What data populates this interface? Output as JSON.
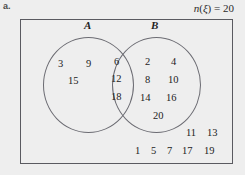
{
  "figure": {
    "part_label": "a.",
    "universal_set": {
      "function_name": "n",
      "open_paren": "(",
      "symbol": "ξ",
      "close_paren": ")",
      "equals": " = ",
      "count": "20",
      "full_text": "n(ξ) = 20"
    },
    "sets": {
      "a_label": "A",
      "b_label": "B"
    }
  },
  "chart_data": {
    "type": "venn",
    "title": "",
    "universal_set_label": "ξ",
    "universal_set_size": 20,
    "sets": [
      "A",
      "B"
    ],
    "regions": {
      "a_only": [
        3,
        9,
        15
      ],
      "intersection": [
        6,
        12,
        18
      ],
      "b_only": [
        2,
        4,
        8,
        10,
        14,
        16,
        20
      ],
      "outside": [
        11,
        13,
        1,
        5,
        7,
        17,
        19
      ]
    },
    "outside_rows": [
      [
        11,
        13
      ],
      [
        1,
        5,
        7,
        17,
        19
      ]
    ],
    "a_only_strings": [
      "3",
      "9",
      "15"
    ],
    "intersection_strings": [
      "6",
      "12",
      "18"
    ],
    "b_only_strings": [
      "2",
      "4",
      "8",
      "10",
      "14",
      "16",
      "20"
    ],
    "outside_row1_strings": [
      "11",
      "13"
    ],
    "outside_row2_strings": [
      "1",
      "5",
      "7",
      "17",
      "19"
    ]
  }
}
